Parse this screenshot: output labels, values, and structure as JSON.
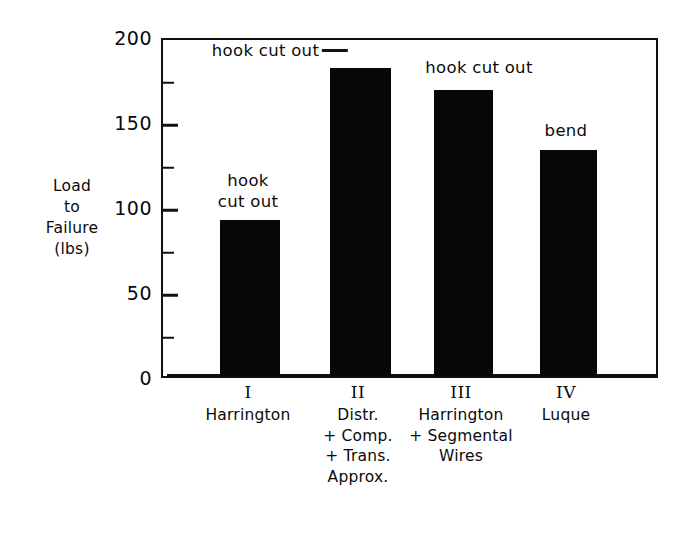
{
  "chart_data": {
    "type": "bar",
    "title": "",
    "subtitle": "",
    "xlabel": "",
    "ylabel": "Load to Failure (lbs)",
    "ylabel_lines": [
      "Load",
      "to",
      "Failure",
      "(lbs)"
    ],
    "ylim": [
      0,
      200
    ],
    "ytick_labels": [
      "0",
      "50",
      "100",
      "150",
      "200"
    ],
    "ytick_values": [
      0,
      50,
      100,
      150,
      200
    ],
    "yminor_values": [
      25,
      75,
      125,
      175
    ],
    "grid": false,
    "legend": "none",
    "categories": [
      "I",
      "II",
      "III",
      "IV"
    ],
    "category_names": [
      "Harrington",
      "Distr. + Comp. + Trans. Approx.",
      "Harrington + Segmental Wires",
      "Luque"
    ],
    "values": [
      92,
      181,
      168,
      133
    ],
    "annotations": [
      "hook cut out",
      "hook cut out",
      "hook cut out",
      "bend"
    ],
    "bar_color": "#080808",
    "axis_color": "#111111",
    "background_color": "#ffffff"
  },
  "axis": {
    "y_title_lines": [
      "Load",
      "to",
      "Failure",
      "(lbs)"
    ],
    "y_labels": [
      {
        "text": "200",
        "value": 200
      },
      {
        "text": "150",
        "value": 150
      },
      {
        "text": "100",
        "value": 100
      },
      {
        "text": "50",
        "value": 50
      },
      {
        "text": "0",
        "value": 0
      }
    ]
  },
  "bars": [
    {
      "numeral": "I",
      "name_lines": [
        "Harrington"
      ],
      "value": 92,
      "annotation_lines": [
        "hook",
        "cut out"
      ],
      "has_leader": false
    },
    {
      "numeral": "II",
      "name_lines": [
        "Distr.",
        "+ Comp.",
        "+ Trans.",
        "Approx."
      ],
      "value": 181,
      "annotation_lines": [
        "hook cut out"
      ],
      "has_leader": true
    },
    {
      "numeral": "III",
      "name_lines": [
        "Harrington",
        "+ Segmental",
        "Wires"
      ],
      "value": 168,
      "annotation_lines": [
        "hook cut  out"
      ],
      "has_leader": false
    },
    {
      "numeral": "IV",
      "name_lines": [
        "Luque"
      ],
      "value": 133,
      "annotation_lines": [
        "bend"
      ],
      "has_leader": false
    }
  ]
}
